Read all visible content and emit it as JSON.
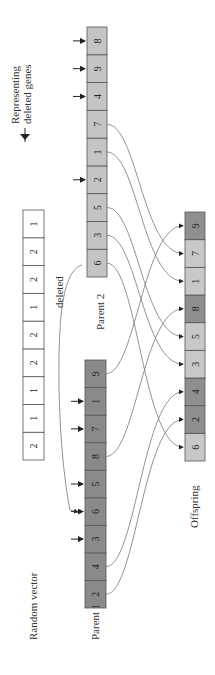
{
  "legend": {
    "line1": "Representing",
    "line2": "deleted genes",
    "icon": "arrow-right-icon"
  },
  "labels": {
    "random_vector": "Random vector",
    "parent1": "Parent 1",
    "parent2": "Parent 2",
    "offspring": "Offspring",
    "deleted": "deleted"
  },
  "colors": {
    "parent1": "#8a8a8a",
    "parent2": "#c4c4c4",
    "offspring_light": "#c8c8c8",
    "offspring_dark": "#8f8f8f",
    "random": "#ffffff"
  },
  "random_vector": [
    "2",
    "1",
    "1",
    "2",
    "2",
    "1",
    "2",
    "2",
    "1"
  ],
  "parent1": {
    "genes": [
      "2",
      "4",
      "3",
      "6",
      "5",
      "8",
      "7",
      "1",
      "9"
    ],
    "deleted": [
      2,
      3,
      4,
      6,
      7
    ]
  },
  "parent2": {
    "genes": [
      "6",
      "3",
      "5",
      "2",
      "1",
      "7",
      "4",
      "9",
      "8"
    ],
    "deleted": [
      3,
      6,
      7,
      8
    ]
  },
  "offspring": {
    "genes": [
      "6",
      "2",
      "4",
      "3",
      "5",
      "8",
      "1",
      "7",
      "9"
    ],
    "from_parent1": [
      1,
      2,
      5,
      8
    ]
  }
}
